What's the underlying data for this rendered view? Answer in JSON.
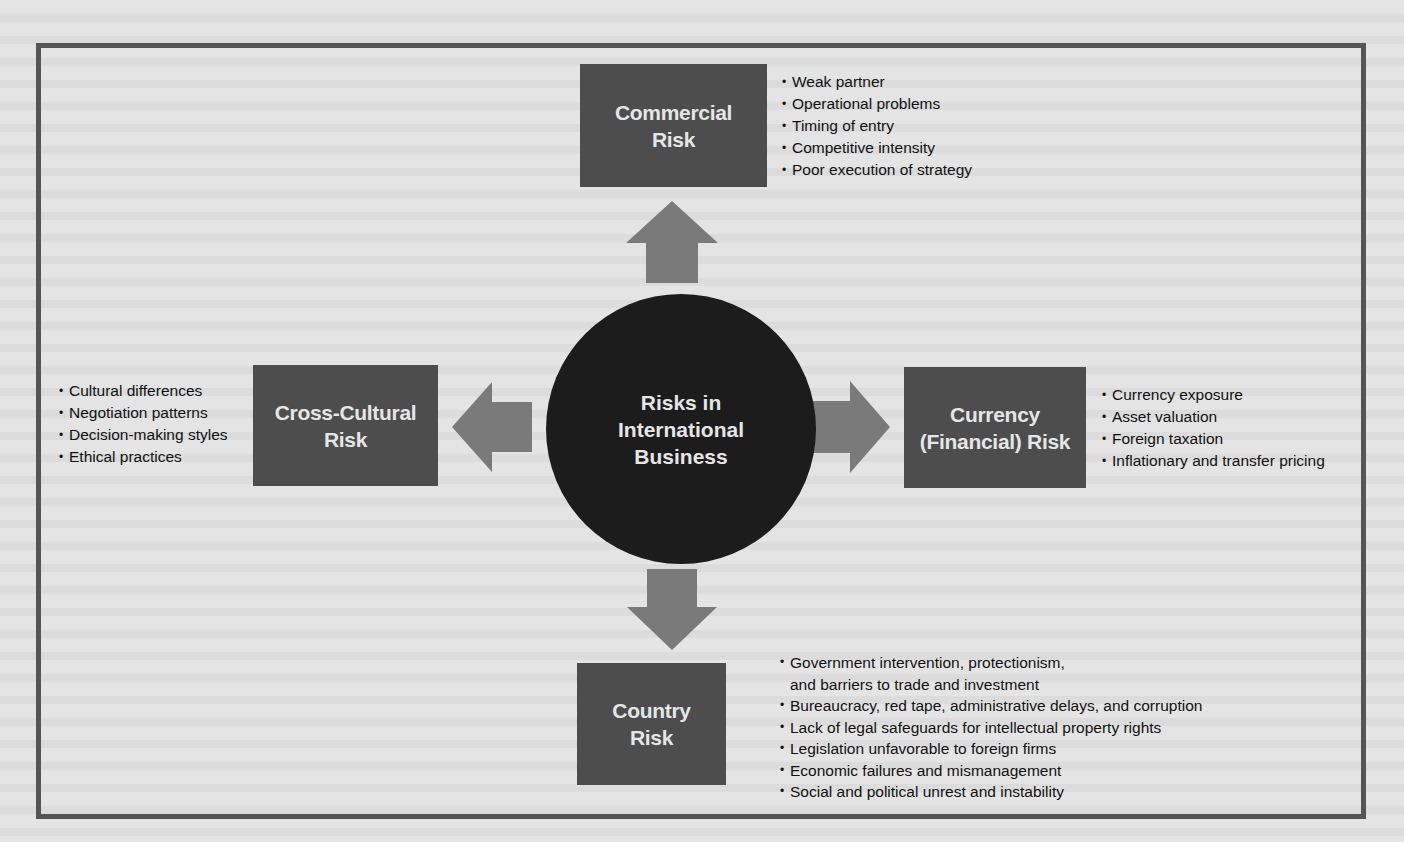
{
  "diagram": {
    "center": {
      "title": "Risks in International Business",
      "lines": [
        "Risks in",
        "International",
        "Business"
      ]
    },
    "risks": {
      "commercial": {
        "title_lines": [
          "Commercial",
          "Risk"
        ],
        "items": [
          "Weak partner",
          "Operational problems",
          "Timing of entry",
          "Competitive intensity",
          "Poor execution of strategy"
        ]
      },
      "cross_cultural": {
        "title_lines": [
          "Cross-Cultural",
          "Risk"
        ],
        "items": [
          "Cultural differences",
          "Negotiation patterns",
          "Decision-making styles",
          "Ethical practices"
        ]
      },
      "currency": {
        "title_lines": [
          "Currency",
          "(Financial) Risk"
        ],
        "items": [
          "Currency exposure",
          "Asset valuation",
          "Foreign taxation",
          "Inflationary and transfer pricing"
        ]
      },
      "country": {
        "title_lines": [
          "Country",
          "Risk"
        ],
        "items": [
          "Government intervention, protectionism,",
          "Bureaucracy, red tape, administrative delays, and corruption",
          "Lack of legal safeguards for intellectual property rights",
          "Legislation unfavorable to foreign firms",
          "Economic failures and mismanagement",
          "Social and political unrest and instability"
        ],
        "item0_continuation": "and barriers to trade and investment"
      }
    },
    "colors": {
      "background": "#e4e4e4",
      "frame": "#555555",
      "box": "#4d4d4d",
      "circle": "#1c1c1c",
      "arrow": "#7a7a7a",
      "box_text": "#e6e6e6"
    }
  }
}
